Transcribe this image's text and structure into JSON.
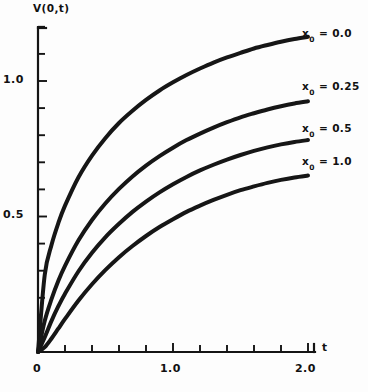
{
  "chart_data": {
    "type": "line",
    "title": "",
    "xlabel": "t",
    "ylabel": "V(0,t)",
    "xlim": [
      0,
      2.0
    ],
    "ylim": [
      0,
      1.3
    ],
    "grid": false,
    "legend_position": "right-of-curve-ends",
    "x_tick_labels": [
      "0",
      "1.0",
      "2.0"
    ],
    "x_tick_values": [
      0,
      1.0,
      2.0
    ],
    "x_minor_tick_values": [
      0.2,
      0.4,
      0.6,
      0.8,
      1.2,
      1.4,
      1.6,
      1.8
    ],
    "y_tick_labels": [
      "0.5",
      "1.0"
    ],
    "y_tick_values": [
      0.5,
      1.0
    ],
    "y_minor_tick_values": [
      0.1,
      0.2,
      0.3,
      0.4,
      0.6,
      0.7,
      0.8,
      0.9,
      1.1,
      1.2
    ],
    "x": [
      0,
      0.05,
      0.1,
      0.15,
      0.2,
      0.3,
      0.4,
      0.5,
      0.6,
      0.7,
      0.8,
      0.9,
      1.0,
      1.1,
      1.2,
      1.3,
      1.4,
      1.5,
      1.6,
      1.7,
      1.8,
      1.9,
      2.0
    ],
    "series": [
      {
        "name": "x0 = 0.0",
        "label": "x",
        "label_sub": "0",
        "label_value": "= 0.0",
        "values": [
          0,
          0.285,
          0.395,
          0.475,
          0.54,
          0.645,
          0.725,
          0.79,
          0.845,
          0.89,
          0.93,
          0.965,
          0.995,
          1.022,
          1.046,
          1.068,
          1.087,
          1.104,
          1.12,
          1.133,
          1.145,
          1.155,
          1.163
        ]
      },
      {
        "name": "x0 = 0.25",
        "label": "x",
        "label_sub": "0",
        "label_value": "= 0.25",
        "values": [
          0,
          0.115,
          0.195,
          0.262,
          0.318,
          0.412,
          0.487,
          0.549,
          0.602,
          0.648,
          0.688,
          0.723,
          0.754,
          0.782,
          0.806,
          0.828,
          0.848,
          0.866,
          0.881,
          0.895,
          0.907,
          0.917,
          0.925
        ]
      },
      {
        "name": "x0 = 0.5",
        "label": "x",
        "label_sub": "0",
        "label_value": "= 0.5",
        "values": [
          0,
          0.055,
          0.115,
          0.168,
          0.215,
          0.298,
          0.366,
          0.424,
          0.473,
          0.517,
          0.555,
          0.589,
          0.619,
          0.646,
          0.67,
          0.691,
          0.71,
          0.727,
          0.742,
          0.755,
          0.766,
          0.775,
          0.782
        ]
      },
      {
        "name": "x0 = 1.0",
        "label": "x",
        "label_sub": "0",
        "label_value": "= 1.0",
        "values": [
          0,
          0.018,
          0.05,
          0.086,
          0.122,
          0.19,
          0.25,
          0.303,
          0.35,
          0.391,
          0.428,
          0.461,
          0.49,
          0.517,
          0.54,
          0.561,
          0.58,
          0.597,
          0.611,
          0.624,
          0.635,
          0.644,
          0.651
        ]
      }
    ]
  },
  "axis": {
    "y_title": "V(0,t)",
    "x_title": "t",
    "y_labels": {
      "one": "1.0",
      "half": "0.5"
    },
    "x_labels": {
      "zero": "0",
      "one": "1.0",
      "two": "2.0"
    }
  },
  "colors": {
    "background": "#fdfdfd",
    "ink": "#141414",
    "curve": "#161616"
  }
}
